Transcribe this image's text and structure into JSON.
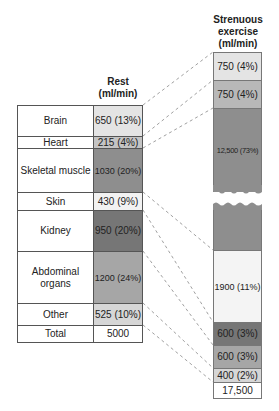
{
  "rest": {
    "header_line1": "Rest",
    "header_line2": "(ml/min)",
    "rows": [
      {
        "label": "Brain",
        "value": "650 (13%)"
      },
      {
        "label": "Heart",
        "value": "215 (4%)"
      },
      {
        "label": "Skeletal muscle",
        "value": "1030 (20%)"
      },
      {
        "label": "Skin",
        "value": "430 (9%)"
      },
      {
        "label": "Kidney",
        "value": "950 (20%)"
      },
      {
        "label": "Abdominal organs",
        "value": "1200 (24%)"
      },
      {
        "label": "Other",
        "value": "525 (10%)"
      }
    ],
    "total_label": "Total",
    "total_value": "5000"
  },
  "exercise": {
    "header_line1": "Strenuous",
    "header_line2": "exercise",
    "header_line3": "(ml/min)",
    "rows": [
      {
        "value": "750 (4%)"
      },
      {
        "value": "750 (4%)"
      },
      {
        "value": "12,500 (73%)"
      },
      {
        "value": "1900 (11%)"
      },
      {
        "value": "600 (3%)"
      },
      {
        "value": "600 (3%)"
      },
      {
        "value": "400 (2%)"
      }
    ],
    "total_value": "17,500"
  },
  "colors": {
    "brain": "#e4e4e4",
    "heart": "#c4c4c4",
    "skeletal_muscle": "#8e8e8e",
    "skin": "#f2f2f2",
    "kidney": "#767676",
    "abdominal": "#a6a6a6",
    "other": "#d6d6d6"
  }
}
